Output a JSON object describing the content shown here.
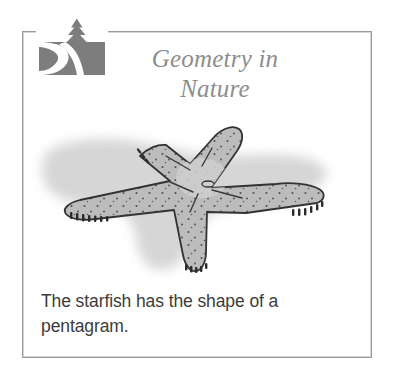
{
  "card": {
    "title_lines": [
      "Geometry in",
      "Nature"
    ],
    "caption_lines": [
      "The starfish has the shape of a",
      "pentagram."
    ],
    "caption_full": "The starfish has the shape of a pentagram.",
    "logo": {
      "name": "nature-river-tree-logo",
      "description": "gray square with white winding river and pine tree"
    },
    "illustration": {
      "name": "starfish-illustration",
      "subject": "starfish",
      "arms": 5,
      "description": "gray speckled five-armed starfish with soft drop shadow"
    },
    "colors": {
      "frame": "#9a9a9a",
      "title_text": "#8d8d8d",
      "caption_text": "#3c3c3c",
      "logo_fill": "#7d7d7d",
      "starfish_fill": "#bdbdbd",
      "starfish_outline": "#3a3a3a",
      "shadow": "#d3d3d3",
      "background": "#ffffff"
    }
  }
}
